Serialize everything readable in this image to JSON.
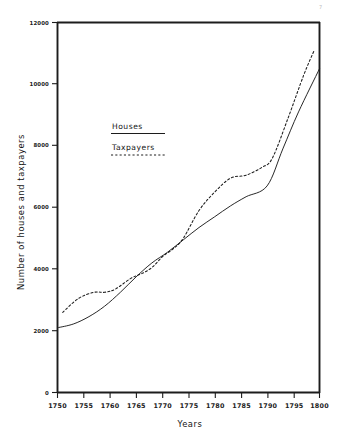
{
  "figure": {
    "corner_mark": "7",
    "background_color": "#ffffff",
    "ink_color": "#1c1c1c"
  },
  "legend": {
    "position": "inside-upper-left",
    "entries": [
      {
        "label": "Houses",
        "style": "solid",
        "color": "#1c1c1c"
      },
      {
        "label": "Taxpayers",
        "style": "dashed",
        "color": "#1c1c1c"
      }
    ]
  },
  "axes": {
    "x_title": "Years",
    "y_title": "Number of houses and taxpayers",
    "x_ticks": [
      "1750",
      "1755",
      "1760",
      "1765",
      "1770",
      "1775",
      "1780",
      "1785",
      "1790",
      "1795",
      "1800"
    ],
    "y_ticks": [
      "0",
      "2000",
      "4000",
      "6000",
      "8000",
      "10000",
      "12000"
    ]
  },
  "chart_data": {
    "type": "line",
    "title": "",
    "subtitle": "",
    "xlabel": "Years",
    "ylabel": "Number of houses and taxpayers",
    "xlim": [
      1750,
      1800
    ],
    "ylim": [
      0,
      12000
    ],
    "xticks": [
      1750,
      1755,
      1760,
      1765,
      1770,
      1775,
      1780,
      1785,
      1790,
      1795,
      1800
    ],
    "yticks": [
      0,
      2000,
      4000,
      6000,
      8000,
      10000,
      12000
    ],
    "grid": false,
    "legend": [
      "Houses",
      "Taxpayers"
    ],
    "legend_position": "inside upper left",
    "series": [
      {
        "name": "Houses",
        "style": "solid",
        "color": "#1c1c1c",
        "x": [
          1750,
          1753,
          1756,
          1759,
          1762,
          1765,
          1768,
          1771,
          1774,
          1777,
          1780,
          1783,
          1786,
          1790,
          1793,
          1796,
          1800
        ],
        "y": [
          2100,
          2220,
          2460,
          2800,
          3250,
          3750,
          4200,
          4550,
          4950,
          5350,
          5700,
          6050,
          6350,
          6700,
          7900,
          9100,
          10500
        ]
      },
      {
        "name": "Taxpayers",
        "style": "dashed",
        "color": "#1c1c1c",
        "x": [
          1751,
          1754,
          1757,
          1759,
          1761,
          1764,
          1766,
          1768,
          1770,
          1772,
          1774,
          1777,
          1780,
          1783,
          1786,
          1789,
          1791,
          1794,
          1797,
          1799
        ],
        "y": [
          2600,
          3050,
          3250,
          3250,
          3350,
          3700,
          3850,
          4050,
          4400,
          4650,
          5000,
          5900,
          6500,
          6950,
          7050,
          7300,
          7600,
          8900,
          10300,
          11100
        ]
      }
    ]
  }
}
